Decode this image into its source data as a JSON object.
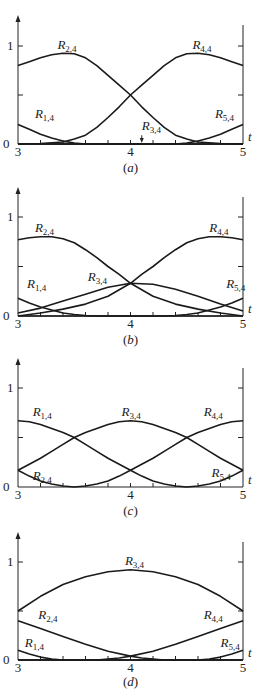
{
  "chart_data": [
    {
      "type": "line",
      "title": "(a)",
      "caption_letter": "a",
      "xlabel": "t",
      "xticks": [
        "3",
        "4",
        "5"
      ],
      "yticks": [
        "0",
        "1"
      ],
      "xlim": [
        3,
        5
      ],
      "ylim": [
        0,
        1.2
      ],
      "series": [
        {
          "name": "R_{1,4}",
          "label_base": "R",
          "label_sub": "1,4",
          "label_at": [
            3.15,
            0.27
          ],
          "x": [
            3,
            3.1,
            3.2,
            3.3,
            3.4,
            3.5,
            3.6,
            4,
            5
          ],
          "y": [
            0.2,
            0.15,
            0.1,
            0.06,
            0.03,
            0.01,
            0,
            0,
            0
          ]
        },
        {
          "name": "R_{2,4}",
          "label_base": "R",
          "label_sub": "2,4",
          "label_at": [
            3.35,
            0.97
          ],
          "x": [
            3,
            3.1,
            3.2,
            3.3,
            3.4,
            3.5,
            3.6,
            3.7,
            3.8,
            3.9,
            4,
            4.1,
            4.2,
            4.3,
            4.4,
            4.5,
            4.6,
            4.8,
            5
          ],
          "y": [
            0.8,
            0.84,
            0.88,
            0.91,
            0.925,
            0.92,
            0.88,
            0.8,
            0.7,
            0.6,
            0.5,
            0.38,
            0.27,
            0.17,
            0.09,
            0.05,
            0.02,
            0.005,
            0
          ]
        },
        {
          "name": "R_{3,4}",
          "label_base": "R",
          "label_sub": "3,4",
          "label_at": [
            4.1,
            0.14
          ],
          "arrow_to": [
            4.1,
            0.01
          ],
          "x": [
            3,
            5
          ],
          "y": [
            0,
            0
          ]
        },
        {
          "name": "R_{4,4}",
          "label_base": "R",
          "label_sub": "4,4",
          "label_at": [
            4.55,
            0.97
          ],
          "x": [
            3,
            3.2,
            3.4,
            3.5,
            3.6,
            3.7,
            3.8,
            3.9,
            4,
            4.1,
            4.2,
            4.3,
            4.4,
            4.5,
            4.6,
            4.7,
            4.8,
            4.9,
            5
          ],
          "y": [
            0,
            0.005,
            0.02,
            0.05,
            0.09,
            0.17,
            0.27,
            0.38,
            0.5,
            0.6,
            0.7,
            0.8,
            0.88,
            0.92,
            0.925,
            0.91,
            0.88,
            0.84,
            0.8
          ]
        },
        {
          "name": "R_{5,4}",
          "label_base": "R",
          "label_sub": "5,4",
          "label_at": [
            4.75,
            0.27
          ],
          "x": [
            3,
            4,
            4.4,
            4.5,
            4.6,
            4.7,
            4.8,
            4.9,
            5
          ],
          "y": [
            0,
            0,
            0,
            0.01,
            0.03,
            0.06,
            0.1,
            0.15,
            0.2
          ]
        }
      ]
    },
    {
      "type": "line",
      "title": "(b)",
      "caption_letter": "b",
      "xlabel": "t",
      "xticks": [
        "3",
        "4",
        "5"
      ],
      "yticks": [
        "0",
        "1"
      ],
      "xlim": [
        3,
        5
      ],
      "ylim": [
        0,
        1.2
      ],
      "series": [
        {
          "name": "R_{1,4}",
          "label_base": "R",
          "label_sub": "1,4",
          "label_at": [
            3.08,
            0.28
          ],
          "x": [
            3,
            3.1,
            3.2,
            3.3,
            3.4,
            3.5,
            3.6,
            3.7,
            4,
            5
          ],
          "y": [
            0.18,
            0.13,
            0.09,
            0.06,
            0.03,
            0.015,
            0.005,
            0,
            0,
            0
          ]
        },
        {
          "name": "R_{2,4}",
          "label_base": "R",
          "label_sub": "2,4",
          "label_at": [
            3.15,
            0.85
          ],
          "x": [
            3,
            3.1,
            3.2,
            3.3,
            3.4,
            3.5,
            3.6,
            3.7,
            3.8,
            3.9,
            4,
            4.2,
            4.4,
            4.6,
            4.8,
            5
          ],
          "y": [
            0.77,
            0.79,
            0.8,
            0.8,
            0.78,
            0.74,
            0.67,
            0.59,
            0.5,
            0.42,
            0.33,
            0.2,
            0.12,
            0.07,
            0.03,
            0
          ]
        },
        {
          "name": "R_{3,4}",
          "label_base": "R",
          "label_sub": "3,4",
          "label_at": [
            3.62,
            0.35
          ],
          "x": [
            3,
            3.2,
            3.4,
            3.6,
            3.8,
            4,
            4.2,
            4.4,
            4.6,
            4.8,
            5
          ],
          "y": [
            0.03,
            0.08,
            0.15,
            0.22,
            0.29,
            0.33,
            0.32,
            0.27,
            0.2,
            0.12,
            0.05
          ]
        },
        {
          "name": "R_{4,4}",
          "label_base": "R",
          "label_sub": "4,4",
          "label_at": [
            4.7,
            0.85
          ],
          "x": [
            3,
            3.2,
            3.4,
            3.6,
            3.8,
            4,
            4.1,
            4.2,
            4.3,
            4.4,
            4.5,
            4.6,
            4.7,
            4.8,
            4.9,
            5
          ],
          "y": [
            0,
            0.03,
            0.07,
            0.12,
            0.2,
            0.33,
            0.42,
            0.5,
            0.59,
            0.67,
            0.74,
            0.78,
            0.8,
            0.8,
            0.79,
            0.77
          ]
        },
        {
          "name": "R_{5,4}",
          "label_base": "R",
          "label_sub": "5,4",
          "label_at": [
            4.85,
            0.28
          ],
          "x": [
            3,
            4,
            4.3,
            4.4,
            4.5,
            4.6,
            4.7,
            4.8,
            4.9,
            5
          ],
          "y": [
            0,
            0,
            0,
            0.005,
            0.015,
            0.03,
            0.06,
            0.09,
            0.13,
            0.18
          ]
        }
      ]
    },
    {
      "type": "line",
      "title": "(c)",
      "caption_letter": "c",
      "xlabel": "t",
      "xticks": [
        "3",
        "4",
        "5"
      ],
      "yticks": [
        "0",
        "1"
      ],
      "xlim": [
        3,
        5
      ],
      "ylim": [
        0,
        1.2
      ],
      "series": [
        {
          "name": "R_{1,4}",
          "label_base": "R",
          "label_sub": "1,4",
          "label_at": [
            3.13,
            0.72
          ],
          "x": [
            3,
            3.1,
            3.2,
            3.3,
            3.4,
            3.5,
            3.6,
            3.7,
            3.8,
            3.9,
            4,
            4.1,
            4.2,
            4.3,
            4.4,
            4.5,
            4.6,
            4.7,
            4.8,
            4.9,
            5
          ],
          "y": [
            0.67,
            0.66,
            0.63,
            0.59,
            0.55,
            0.5,
            0.43,
            0.36,
            0.29,
            0.23,
            0.17,
            0.11,
            0.06,
            0.03,
            0.01,
            0,
            0.01,
            0.03,
            0.06,
            0.11,
            0.17
          ]
        },
        {
          "name": "R_{2,4}",
          "label_base": "R",
          "label_sub": "2,4",
          "label_at": [
            3.13,
            0.07
          ],
          "x": [
            3,
            3.1,
            3.2,
            3.3,
            3.4,
            3.5,
            3.6,
            3.7,
            3.8,
            3.9,
            4,
            4.1,
            4.2,
            4.3,
            4.4,
            4.5,
            4.6,
            4.7,
            4.8,
            4.9,
            5
          ],
          "y": [
            0.17,
            0.11,
            0.06,
            0.03,
            0.01,
            0,
            0.01,
            0.03,
            0.06,
            0.11,
            0.17,
            0.23,
            0.29,
            0.36,
            0.43,
            0.5,
            0.55,
            0.59,
            0.63,
            0.66,
            0.67
          ]
        },
        {
          "name": "R_{3,4}",
          "label_base": "R",
          "label_sub": "3,4",
          "label_at": [
            3.92,
            0.72
          ],
          "x": [
            3,
            3.1,
            3.2,
            3.3,
            3.4,
            3.5,
            3.6,
            3.7,
            3.8,
            3.9,
            4,
            4.1,
            4.2,
            4.3,
            4.4,
            4.5,
            4.6,
            4.7,
            4.8,
            4.9,
            5
          ],
          "y": [
            0.17,
            0.23,
            0.29,
            0.36,
            0.43,
            0.5,
            0.55,
            0.59,
            0.63,
            0.66,
            0.67,
            0.66,
            0.63,
            0.59,
            0.55,
            0.5,
            0.43,
            0.36,
            0.29,
            0.23,
            0.17
          ]
        },
        {
          "name": "R_{4,4}",
          "label_base": "R",
          "label_sub": "4,4",
          "label_at": [
            4.65,
            0.72
          ],
          "x": [],
          "y": []
        },
        {
          "name": "R_{5,4}",
          "label_base": "R",
          "label_sub": "5,4",
          "label_at": [
            4.72,
            0.1
          ],
          "x": [],
          "y": []
        }
      ]
    },
    {
      "type": "line",
      "title": "(d)",
      "caption_letter": "d",
      "xlabel": "t",
      "xticks": [
        "3",
        "4",
        "5"
      ],
      "yticks": [
        "0",
        "1"
      ],
      "xlim": [
        3,
        5
      ],
      "ylim": [
        0,
        1.2
      ],
      "series": [
        {
          "name": "R_{1,4}",
          "label_base": "R",
          "label_sub": "1,4",
          "label_at": [
            3.06,
            0.13
          ],
          "x": [
            3,
            3.1,
            3.2,
            3.3,
            3.4,
            3.5,
            4,
            5
          ],
          "y": [
            0.1,
            0.06,
            0.03,
            0.01,
            0,
            0,
            0,
            0
          ]
        },
        {
          "name": "R_{2,4}",
          "label_base": "R",
          "label_sub": "2,4",
          "label_at": [
            3.18,
            0.42
          ],
          "x": [
            3,
            3.2,
            3.4,
            3.6,
            3.8,
            4,
            4.1,
            4.2,
            4.3,
            4.5,
            5
          ],
          "y": [
            0.4,
            0.32,
            0.24,
            0.16,
            0.09,
            0.04,
            0.02,
            0.01,
            0,
            0,
            0
          ]
        },
        {
          "name": "R_{3,4}",
          "label_base": "R",
          "label_sub": "3,4",
          "label_at": [
            3.95,
            0.97
          ],
          "x": [
            3,
            3.2,
            3.4,
            3.6,
            3.8,
            4,
            4.2,
            4.4,
            4.6,
            4.8,
            5
          ],
          "y": [
            0.5,
            0.65,
            0.77,
            0.85,
            0.9,
            0.92,
            0.9,
            0.85,
            0.77,
            0.65,
            0.5
          ]
        },
        {
          "name": "R_{4,4}",
          "label_base": "R",
          "label_sub": "4,4",
          "label_at": [
            4.65,
            0.42
          ],
          "x": [
            3,
            3.5,
            3.7,
            3.8,
            3.9,
            4,
            4.2,
            4.4,
            4.6,
            4.8,
            5
          ],
          "y": [
            0,
            0,
            0,
            0.01,
            0.02,
            0.04,
            0.09,
            0.16,
            0.24,
            0.32,
            0.4
          ]
        },
        {
          "name": "R_{5,4}",
          "label_base": "R",
          "label_sub": "5,4",
          "label_at": [
            4.8,
            0.13
          ],
          "x": [
            3,
            4.5,
            4.6,
            4.7,
            4.8,
            4.9,
            5
          ],
          "y": [
            0,
            0,
            0,
            0.01,
            0.03,
            0.06,
            0.1
          ]
        }
      ]
    }
  ],
  "layout": {
    "panels": [
      {
        "y0": 144,
        "y1": 46,
        "top": 15,
        "cap_y": 172
      },
      {
        "y0": 316,
        "y1": 217,
        "top": 187,
        "cap_y": 344
      },
      {
        "y0": 487,
        "y1": 388,
        "top": 358,
        "cap_y": 515
      },
      {
        "y0": 660,
        "y1": 562,
        "top": 532,
        "cap_y": 686
      }
    ],
    "x_left": 18,
    "x_right": 243
  }
}
